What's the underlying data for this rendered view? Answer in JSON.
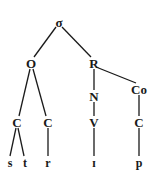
{
  "diagram": {
    "type": "syllable-tree",
    "nodes": {
      "syllable": {
        "label": "σ",
        "x": 59,
        "y": 22
      },
      "onset": {
        "label": "O",
        "x": 31,
        "y": 63
      },
      "rhyme": {
        "label": "R",
        "x": 94,
        "y": 63
      },
      "nucleus": {
        "label": "N",
        "x": 94,
        "y": 96
      },
      "coda": {
        "label": "Co",
        "x": 139,
        "y": 89
      },
      "onset_c1": {
        "label": "C",
        "x": 17,
        "y": 122
      },
      "onset_c2": {
        "label": "C",
        "x": 48,
        "y": 122
      },
      "nucleus_v": {
        "label": "V",
        "x": 94,
        "y": 122
      },
      "coda_c": {
        "label": "C",
        "x": 139,
        "y": 122
      },
      "seg_s": {
        "label": "s",
        "x": 10,
        "y": 163
      },
      "seg_t": {
        "label": "t",
        "x": 25,
        "y": 163
      },
      "seg_r": {
        "label": "r",
        "x": 48,
        "y": 163
      },
      "seg_i": {
        "label": "ɪ",
        "x": 94,
        "y": 163
      },
      "seg_p": {
        "label": "p",
        "x": 139,
        "y": 163
      }
    },
    "edges": [
      [
        "syllable",
        "onset"
      ],
      [
        "syllable",
        "rhyme"
      ],
      [
        "rhyme",
        "nucleus"
      ],
      [
        "rhyme",
        "coda"
      ],
      [
        "onset",
        "onset_c1"
      ],
      [
        "onset",
        "onset_c2"
      ],
      [
        "nucleus",
        "nucleus_v"
      ],
      [
        "coda",
        "coda_c"
      ],
      [
        "onset_c1",
        "seg_s"
      ],
      [
        "onset_c1",
        "seg_t"
      ],
      [
        "onset_c2",
        "seg_r"
      ],
      [
        "nucleus_v",
        "seg_i"
      ],
      [
        "coda_c",
        "seg_p"
      ]
    ]
  }
}
